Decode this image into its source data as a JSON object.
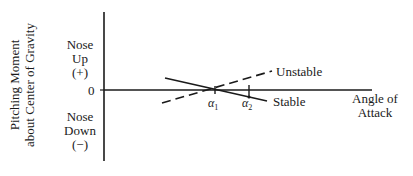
{
  "diagram": {
    "y_axis_title": [
      "Pitching Moment",
      "about Center of Gravity"
    ],
    "nose_up": [
      "Nose",
      "Up",
      "(+)"
    ],
    "zero_label": "0",
    "nose_down": [
      "Nose",
      "Down",
      "(−)"
    ],
    "x_axis_title": [
      "Angle of",
      "Attack"
    ],
    "curves": [
      {
        "name": "Unstable",
        "style": "dashed",
        "slope": "positive"
      },
      {
        "name": "Stable",
        "style": "solid",
        "slope": "negative"
      }
    ],
    "markers": [
      {
        "symbol": "α",
        "subscript": "1"
      },
      {
        "symbol": "α",
        "subscript": "2"
      }
    ]
  }
}
